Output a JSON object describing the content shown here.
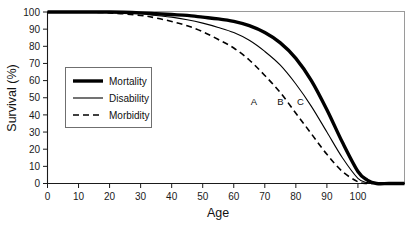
{
  "chart_data": {
    "type": "line",
    "title": "",
    "xlabel": "Age",
    "ylabel": "Survival (%)",
    "xlim": [
      0,
      115
    ],
    "ylim": [
      0,
      100
    ],
    "grid": false,
    "legend_position": "center-left",
    "xticks": [
      0,
      10,
      20,
      30,
      40,
      50,
      60,
      70,
      80,
      90,
      100
    ],
    "yticks": [
      0,
      10,
      20,
      30,
      40,
      50,
      60,
      70,
      80,
      90,
      100
    ],
    "x": [
      0,
      10,
      20,
      30,
      35,
      40,
      45,
      50,
      55,
      60,
      65,
      70,
      75,
      80,
      85,
      90,
      95,
      100,
      103,
      106,
      110,
      115
    ],
    "series": [
      {
        "name": "Mortality",
        "style": "thick-solid",
        "stroke_width": 3.4,
        "dash": "none",
        "values": [
          100,
          100,
          100,
          99.5,
          99,
          98.5,
          98,
          97,
          96,
          94.5,
          92,
          88,
          82,
          73,
          60,
          43,
          24,
          7,
          2,
          0,
          0,
          0
        ]
      },
      {
        "name": "Disability",
        "style": "thin-solid",
        "stroke_width": 1.1,
        "dash": "none",
        "values": [
          100,
          100,
          99.8,
          99,
          98,
          97,
          95.5,
          93.5,
          91,
          88,
          83.5,
          77,
          69,
          58,
          45,
          30,
          15,
          3,
          0.5,
          0,
          0,
          0
        ]
      },
      {
        "name": "Morbidity",
        "style": "dashed",
        "stroke_width": 1.6,
        "dash": "6,4",
        "values": [
          100,
          100,
          99.5,
          98,
          96.5,
          94.5,
          92,
          88.5,
          84,
          79,
          72,
          63,
          53,
          41,
          29,
          17,
          7,
          1,
          0,
          0,
          0,
          0
        ]
      }
    ],
    "annotations": [
      {
        "label": "A",
        "x": 66.5,
        "y": 45.5
      },
      {
        "label": "B",
        "x": 75,
        "y": 45.5
      },
      {
        "label": "C",
        "x": 81.5,
        "y": 45.5
      }
    ],
    "legend_entries": [
      {
        "label": "Mortality",
        "style": "thick-solid"
      },
      {
        "label": "Disability",
        "style": "thin-solid"
      },
      {
        "label": "Morbidity",
        "style": "dashed"
      }
    ],
    "colors": {
      "line": "#000000",
      "axis": "#1a1a1a",
      "frame": "#9a9a9a",
      "text": "#111111",
      "background": "#ffffff"
    }
  }
}
